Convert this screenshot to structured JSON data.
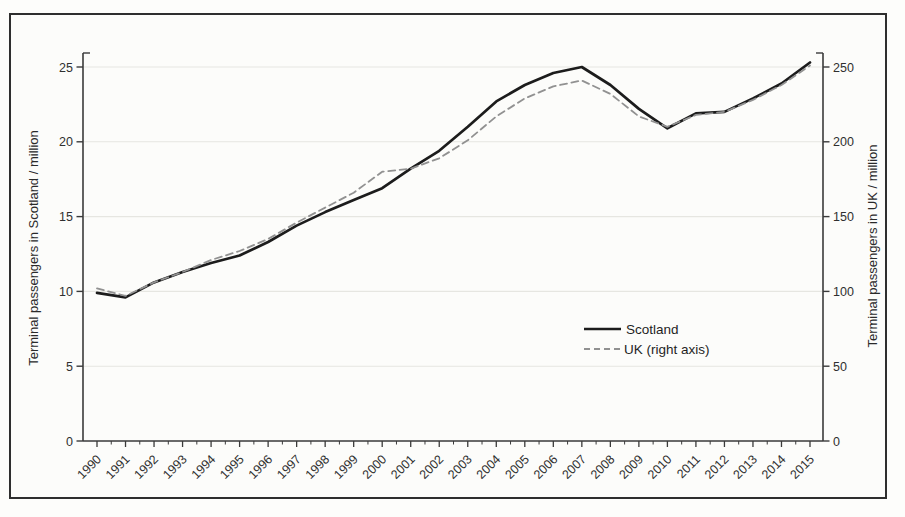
{
  "chart_data": {
    "type": "line",
    "title": "",
    "x": [
      1990,
      1991,
      1992,
      1993,
      1994,
      1995,
      1996,
      1997,
      1998,
      1999,
      2000,
      2001,
      2002,
      2003,
      2004,
      2005,
      2006,
      2007,
      2008,
      2009,
      2010,
      2011,
      2012,
      2013,
      2014,
      2015
    ],
    "series": [
      {
        "name": "Scotland",
        "axis": "left",
        "style": "solid",
        "color": "#1c1c1c",
        "values": [
          9.9,
          9.6,
          10.6,
          11.3,
          11.9,
          12.4,
          13.3,
          14.4,
          15.3,
          16.1,
          16.9,
          18.2,
          19.4,
          21.0,
          22.7,
          23.8,
          24.6,
          25.0,
          23.8,
          22.2,
          20.9,
          21.9,
          22.0,
          22.9,
          23.9,
          25.3
        ]
      },
      {
        "name": "UK (right axis)",
        "axis": "right",
        "style": "dashed",
        "color": "#919191",
        "values": [
          102,
          97,
          106,
          113,
          121,
          127,
          135,
          146,
          156,
          166,
          180,
          182,
          189,
          201,
          217,
          229,
          237,
          241,
          232,
          217,
          210,
          218,
          220,
          228,
          238,
          251
        ]
      }
    ],
    "ylabel_left": "Terminal passengers in Scotland / million",
    "ylabel_right": "Terminal passengers in UK / million",
    "xlabel": "",
    "yticks_left": [
      0,
      5,
      10,
      15,
      20,
      25
    ],
    "yticks_right": [
      0,
      50,
      100,
      150,
      200,
      250
    ],
    "ylim_left": [
      0,
      26
    ],
    "ylim_right": [
      0,
      260
    ],
    "grid": "horizontal-major",
    "legend_position": "center-right"
  },
  "colors": {
    "frame_border": "#2e2e2e",
    "axis": "#3a3a3a",
    "gridline": "#e6e6e1",
    "tick_text": "#2f2f2f",
    "paper": "#fcfcfa"
  }
}
